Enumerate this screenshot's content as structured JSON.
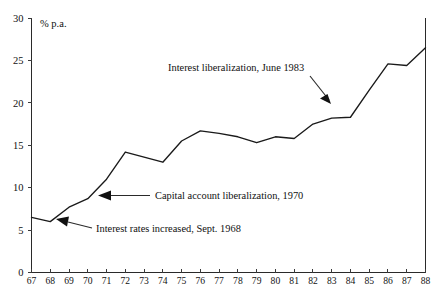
{
  "chart_data": {
    "type": "line",
    "title": "",
    "subtitle": "",
    "xlabel": "",
    "ylabel": "% p.a.",
    "unit_label": "% p.a.",
    "xlim": [
      67,
      88
    ],
    "ylim": [
      0,
      30
    ],
    "ytick_step": 5,
    "grid": false,
    "legend": null,
    "x": [
      67,
      68,
      69,
      70,
      71,
      72,
      73,
      74,
      75,
      76,
      77,
      78,
      79,
      80,
      81,
      82,
      83,
      84,
      85,
      86,
      87,
      88
    ],
    "categories": [
      "67",
      "68",
      "69",
      "70",
      "71",
      "72",
      "73",
      "74",
      "75",
      "76",
      "77",
      "78",
      "79",
      "80",
      "81",
      "82",
      "83",
      "84",
      "85",
      "86",
      "87",
      "88"
    ],
    "values": [
      6.5,
      6.0,
      7.7,
      8.7,
      11.0,
      14.2,
      13.6,
      13.0,
      15.5,
      16.7,
      16.4,
      16.0,
      15.3,
      16.0,
      15.8,
      17.5,
      18.2,
      18.3,
      21.5,
      24.6,
      24.4,
      26.5
    ],
    "series": [
      {
        "name": "Interest rate (% p.a.)",
        "values": [
          6.5,
          6.0,
          7.7,
          8.7,
          11.0,
          14.2,
          13.6,
          13.0,
          15.5,
          16.7,
          16.4,
          16.0,
          15.3,
          16.0,
          15.8,
          17.5,
          18.2,
          18.3,
          21.5,
          24.6,
          24.4,
          26.5
        ]
      }
    ],
    "ytick_labels": [
      "0",
      "5",
      "10",
      "15",
      "20",
      "25",
      "30"
    ],
    "ytick_values": [
      0,
      5,
      10,
      15,
      20,
      25,
      30
    ],
    "xtick_labels": [
      "67",
      "68",
      "69",
      "70",
      "71",
      "72",
      "73",
      "74",
      "75",
      "76",
      "77",
      "78",
      "79",
      "80",
      "81",
      "82",
      "83",
      "84",
      "85",
      "86",
      "87",
      "88"
    ],
    "annotations": [
      {
        "id": "interest-liberalization-1983",
        "text": "Interest liberalization, June 1983",
        "target_x": 83,
        "target_y": 18.2
      },
      {
        "id": "capital-account-liberalization-1970",
        "text": "Capital account liberalization, 1970",
        "target_x": 70,
        "target_y": 8.7
      },
      {
        "id": "interest-rates-increased-1968",
        "text": "Interest rates increased, Sept. 1968",
        "target_x": 68,
        "target_y": 6.0
      }
    ],
    "colors": {
      "line": "#1a1a1a",
      "axis": "#2a2a2a",
      "text": "#111111",
      "background": "#ffffff"
    }
  }
}
